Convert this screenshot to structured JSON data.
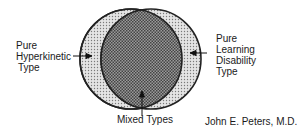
{
  "diagram": {
    "type": "venn",
    "sets": [
      {
        "label_lines": [
          "Pure",
          "Hyperkinetic",
          "Type"
        ]
      },
      {
        "label_lines": [
          "Pure",
          "Learning",
          "Disability",
          "Type"
        ]
      }
    ],
    "intersection_label": "Mixed Types",
    "credit": "John E. Peters, M.D."
  }
}
